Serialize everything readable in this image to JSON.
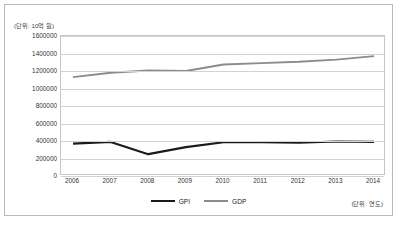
{
  "labels": {
    "unit_y": "(단위: 10억 원)",
    "unit_x": "(단위: 연도)"
  },
  "legend": {
    "items": [
      {
        "name": "GPI",
        "color": "#1a1a1a"
      },
      {
        "name": "GDP",
        "color": "#8c8c8c"
      }
    ]
  },
  "chart_data": {
    "type": "line",
    "title": "",
    "xlabel": "(단위: 연도)",
    "ylabel": "(단위: 10억 원)",
    "categories": [
      "2006",
      "2007",
      "2008",
      "2009",
      "2010",
      "2011",
      "2012",
      "2013",
      "2014"
    ],
    "yticks": [
      0,
      200000,
      400000,
      600000,
      800000,
      1000000,
      1200000,
      1400000,
      1600000
    ],
    "ytick_labels": [
      "0",
      "200000",
      "400000",
      "600000",
      "800000",
      "1000000",
      "1200000",
      "1400000",
      "1600000"
    ],
    "ylim": [
      0,
      1600000
    ],
    "grid": true,
    "legend_position": "bottom",
    "series": [
      {
        "name": "GPI",
        "color": "#1a1a1a",
        "values": [
          370000,
          390000,
          250000,
          330000,
          385000,
          385000,
          380000,
          395000,
          390000
        ]
      },
      {
        "name": "GDP",
        "color": "#8c8c8c",
        "values": [
          1130000,
          1180000,
          1205000,
          1200000,
          1275000,
          1290000,
          1305000,
          1330000,
          1370000
        ]
      }
    ]
  }
}
